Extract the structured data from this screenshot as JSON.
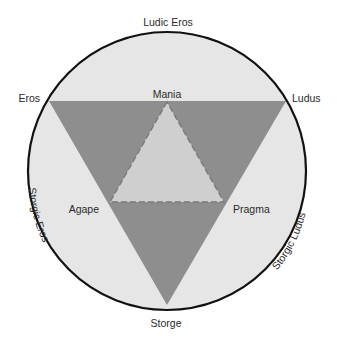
{
  "diagram": {
    "type": "love-styles-color-wheel",
    "colors": {
      "background": "#ffffff",
      "circle_fill": "#e6e6e6",
      "circle_stroke": "#111111",
      "outer_triangle_fill": "#8e8e8e",
      "inner_triangle_fill": "#cfcfcf",
      "dashed_stroke": "#7a7a7a",
      "label_color": "#2a2a2a"
    },
    "labels": {
      "top": "Ludic Eros",
      "upper_left": "Eros",
      "upper_center": "Mania",
      "upper_right": "Ludus",
      "mid_left": "Agape",
      "mid_right": "Pragma",
      "lower_left_arc": "Storgic Eros",
      "lower_right_arc": "Storgic Ludus",
      "bottom": "Storge"
    },
    "primary_styles": [
      "Eros",
      "Ludus",
      "Storge"
    ],
    "secondary_styles": [
      "Mania",
      "Pragma",
      "Agape"
    ],
    "mixed_styles": [
      "Ludic Eros",
      "Storgic Ludus",
      "Storgic Eros"
    ]
  }
}
